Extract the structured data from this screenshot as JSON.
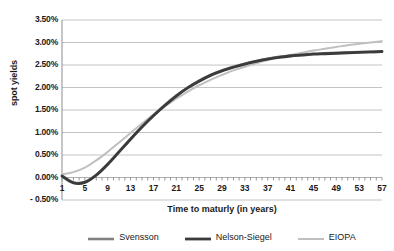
{
  "chart_data": {
    "type": "line",
    "title": "",
    "xlabel": "Time to maturly (in years)",
    "ylabel": "spot yields",
    "xlim": [
      1,
      57
    ],
    "ylim": [
      -0.5,
      3.5
    ],
    "grid": true,
    "legend_position": "bottom",
    "x_tick_labels": [
      "1",
      "5",
      "9",
      "13",
      "17",
      "21",
      "25",
      "29",
      "33",
      "37",
      "41",
      "45",
      "49",
      "53",
      "57"
    ],
    "y_tick_labels": [
      "3.50%",
      "3.00%",
      "2.50%",
      "2.00%",
      "1.50%",
      "1.00%",
      "0.50%",
      "0.00%",
      "- 0.50%"
    ],
    "y_tick_values": [
      3.5,
      3.0,
      2.5,
      2.0,
      1.5,
      1.0,
      0.5,
      0.0,
      -0.5
    ],
    "x": [
      1,
      3,
      5,
      7,
      9,
      11,
      13,
      15,
      17,
      19,
      21,
      23,
      25,
      27,
      29,
      31,
      33,
      35,
      37,
      39,
      41,
      43,
      45,
      47,
      49,
      51,
      53,
      55,
      57
    ],
    "series": [
      {
        "name": "Svensson",
        "color": "#808080",
        "width": 2.6,
        "values": [
          0.04,
          -0.11,
          -0.1,
          0.06,
          0.3,
          0.58,
          0.86,
          1.13,
          1.38,
          1.61,
          1.82,
          2.0,
          2.15,
          2.28,
          2.38,
          2.46,
          2.53,
          2.59,
          2.64,
          2.68,
          2.71,
          2.73,
          2.75,
          2.76,
          2.77,
          2.78,
          2.79,
          2.79,
          2.8
        ]
      },
      {
        "name": "Nelson-Siegel",
        "color": "#3b3b3b",
        "width": 2.8,
        "values": [
          0.03,
          -0.12,
          -0.11,
          0.05,
          0.29,
          0.57,
          0.85,
          1.12,
          1.37,
          1.6,
          1.81,
          1.99,
          2.14,
          2.27,
          2.37,
          2.45,
          2.52,
          2.58,
          2.63,
          2.67,
          2.7,
          2.72,
          2.74,
          2.75,
          2.76,
          2.77,
          2.78,
          2.79,
          2.8
        ]
      },
      {
        "name": "EIOPA",
        "color": "#c0c0c0",
        "width": 2.0,
        "values": [
          0.07,
          0.12,
          0.22,
          0.38,
          0.57,
          0.78,
          0.99,
          1.2,
          1.4,
          1.58,
          1.75,
          1.91,
          2.05,
          2.17,
          2.28,
          2.38,
          2.46,
          2.54,
          2.61,
          2.67,
          2.72,
          2.77,
          2.82,
          2.86,
          2.9,
          2.94,
          2.97,
          3.0,
          3.03
        ]
      }
    ]
  },
  "axes": {
    "plot_left": 62,
    "plot_right": 382,
    "plot_top": 20,
    "plot_bottom": 200
  }
}
